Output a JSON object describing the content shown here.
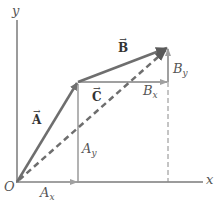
{
  "diagram": {
    "colors": {
      "vector": "#6e6e6e",
      "component": "#9a9a9a",
      "axis": "#7a7a7a",
      "dashed": "#6e6e6e",
      "label": "#555555"
    },
    "axes": {
      "x_label": "x",
      "y_label": "y",
      "origin_label": "O"
    },
    "vectors": [
      {
        "name": "A",
        "label": "A",
        "arrow": "→",
        "from": [
          17,
          182
        ],
        "to": [
          78,
          82
        ],
        "style": "solid"
      },
      {
        "name": "B",
        "label": "B",
        "arrow": "→",
        "from": [
          78,
          82
        ],
        "to": [
          168,
          48
        ],
        "style": "solid"
      },
      {
        "name": "C",
        "label": "C",
        "arrow": "→",
        "from": [
          17,
          182
        ],
        "to": [
          168,
          48
        ],
        "style": "dashed"
      }
    ],
    "components": [
      {
        "name": "Ax",
        "base": "A",
        "sub": "x"
      },
      {
        "name": "Ay",
        "base": "A",
        "sub": "y"
      },
      {
        "name": "Bx",
        "base": "B",
        "sub": "x"
      },
      {
        "name": "By",
        "base": "B",
        "sub": "y"
      }
    ]
  }
}
